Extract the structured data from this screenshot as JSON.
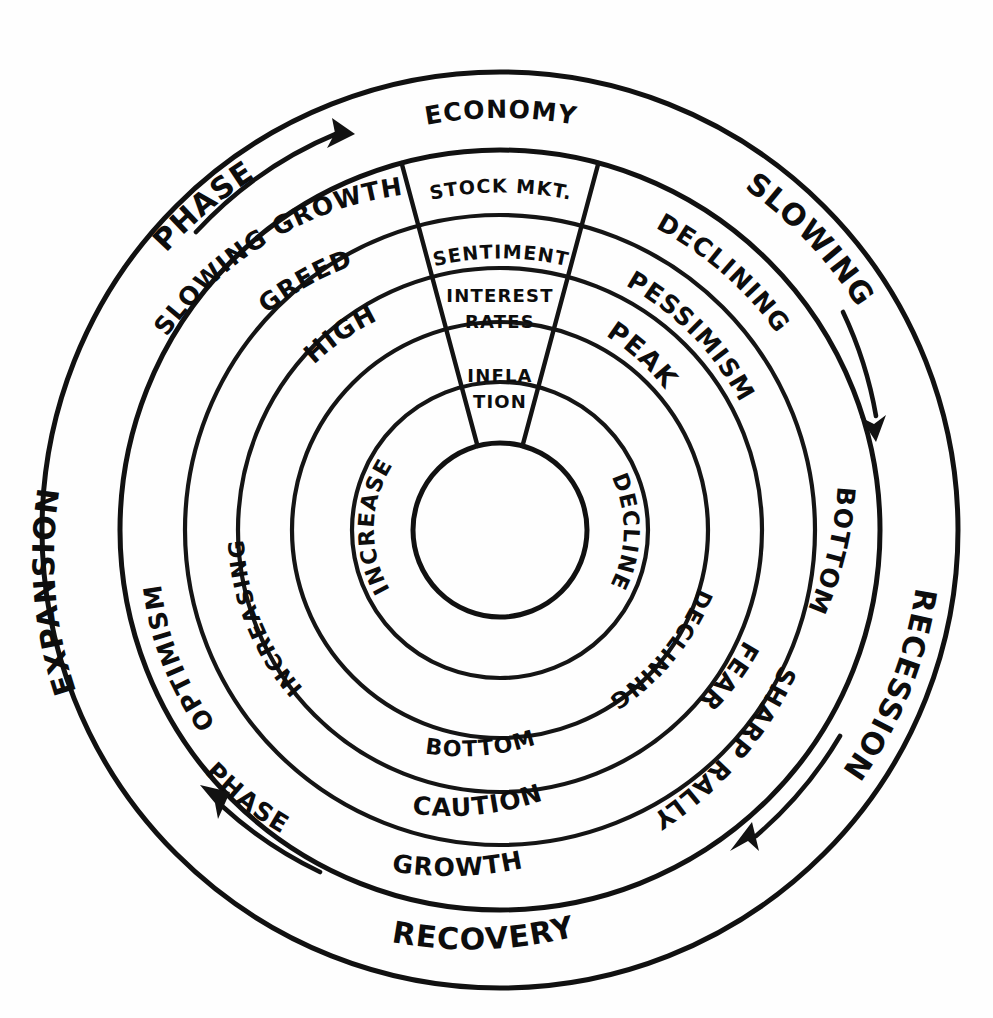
{
  "diagram": {
    "style": "hand-drawn",
    "ink_color": "#111111",
    "background_color": "#ffffff",
    "center": {
      "x": 500,
      "y": 530
    },
    "center_circle_label": "",
    "rings": [
      {
        "index": 1,
        "name": "phase",
        "header": "",
        "outer_radius": 458,
        "inner_radius": 380
      },
      {
        "index": 2,
        "name": "economy",
        "header": "ECONOMY",
        "outer_radius": 380,
        "inner_radius": 315
      },
      {
        "index": 3,
        "name": "stock-market",
        "header": "STOCK MKT.",
        "outer_radius": 315,
        "inner_radius": 262
      },
      {
        "index": 4,
        "name": "sentiment",
        "header": "SENTIMENT",
        "outer_radius": 262,
        "inner_radius": 208
      },
      {
        "index": 5,
        "name": "interest-rates",
        "header": "INTEREST RATES",
        "outer_radius": 208,
        "inner_radius": 148
      },
      {
        "index": 6,
        "name": "inflation",
        "header": "INFLATION",
        "outer_radius": 148,
        "inner_radius": 87
      }
    ],
    "headers": {
      "economy": "ECONOMY",
      "stock_mkt": "STOCK MKT.",
      "sentiment": "SENTIMENT",
      "interest_rates_line1": "INTEREST",
      "interest_rates_line2": "RATES",
      "inflation_line1": "INFLA",
      "inflation_line2": "TION"
    },
    "ring_labels": {
      "phase": [
        {
          "text": "SLOWING",
          "position": "top-right"
        },
        {
          "text": "RECESSION",
          "position": "right"
        },
        {
          "text": "RECOVERY",
          "position": "bottom"
        },
        {
          "text": "EXPANSION",
          "position": "left"
        },
        {
          "text": "PHASE",
          "position": "top-left"
        }
      ],
      "economy": [
        {
          "text": "DECLINING",
          "position": "top-right"
        },
        {
          "text": "BOTTOM",
          "position": "right"
        },
        {
          "text": "SHARP RALLY",
          "position": "bottom-right"
        },
        {
          "text": "GROWTH",
          "position": "bottom"
        },
        {
          "text": "PHASE",
          "position": "bottom-left"
        },
        {
          "text": "SLOWING GROWTH",
          "position": "top-left"
        }
      ],
      "stock_market": [
        {
          "text": "PESSIMISM",
          "position": "top-right"
        },
        {
          "text": "FEAR",
          "position": "right"
        },
        {
          "text": "CAUTION",
          "position": "bottom"
        },
        {
          "text": "OPTIMISM",
          "position": "left"
        },
        {
          "text": "GREED",
          "position": "top-left"
        }
      ],
      "sentiment": [
        {
          "text": "PEAK",
          "position": "top-right"
        },
        {
          "text": "DECLINING",
          "position": "right"
        },
        {
          "text": "BOTTOM",
          "position": "bottom"
        },
        {
          "text": "INCREASING",
          "position": "left"
        },
        {
          "text": "HIGH",
          "position": "top-left"
        }
      ],
      "inner": [
        {
          "text": "DECLINE",
          "position": "right"
        },
        {
          "text": "INCREASE",
          "position": "left"
        }
      ]
    },
    "arrows": [
      {
        "id": "arrow-top-left",
        "direction": "clockwise",
        "ring": "phase",
        "position": "top-left"
      },
      {
        "id": "arrow-right",
        "direction": "clockwise",
        "ring": "phase",
        "position": "right"
      },
      {
        "id": "arrow-bottom-right",
        "direction": "clockwise",
        "ring": "phase",
        "position": "bottom-right"
      },
      {
        "id": "arrow-bottom-left",
        "direction": "clockwise",
        "ring": "phase",
        "position": "bottom-left"
      }
    ]
  }
}
